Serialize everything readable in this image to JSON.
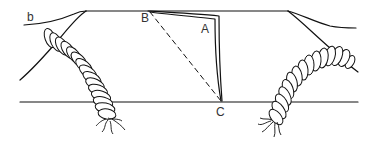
{
  "diagram": {
    "type": "cross-section line drawing",
    "labels": {
      "b": "b",
      "B": "B",
      "A": "A",
      "C": "C"
    },
    "colors": {
      "line": "#111111",
      "label": "#333333",
      "background": "#ffffff"
    },
    "elements": [
      "outer profile curve b",
      "top surface line",
      "baseline",
      "dashed diagonal B to C",
      "curved double line B to A to C",
      "left segmented root/worm form",
      "right segmented root/worm form"
    ]
  }
}
